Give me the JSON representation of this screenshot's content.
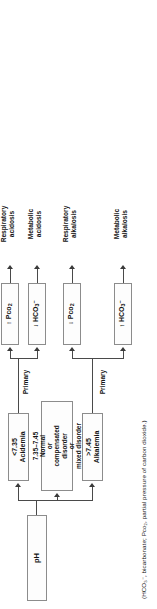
{
  "diagram": {
    "root": {
      "label": "pH"
    },
    "branches": [
      {
        "id": "alkalemia",
        "condition_line1": ">7.45",
        "condition_line2": "Alkalemia",
        "primary_label": "Primary",
        "outcomes": [
          {
            "id": "hco3-up",
            "measure_arrow": "↑",
            "measure_text": "HCO",
            "measure_sub": "3",
            "measure_sup": "−",
            "result_line1": "Metabolic",
            "result_line2": "alkalosis"
          },
          {
            "id": "pco2-down",
            "measure_arrow": "↓",
            "measure_text": "Pco",
            "measure_sub": "2",
            "measure_sup": "",
            "result_line1": "Respiratory",
            "result_line2": "alkalosis"
          }
        ]
      },
      {
        "id": "normal",
        "line1": "7.35–7.45",
        "line2": "Normal",
        "line3": "or",
        "line4": "compensated",
        "line5": "disorder",
        "line6": "or",
        "line7": "mixed disorder"
      },
      {
        "id": "acidemia",
        "condition_line1": "<7.35",
        "condition_line2": "Acidemia",
        "primary_label": "Primary",
        "outcomes": [
          {
            "id": "hco3-down",
            "measure_arrow": "↓",
            "measure_text": "HCO",
            "measure_sub": "3",
            "measure_sup": "−",
            "result_line1": "Metabolic",
            "result_line2": "acidosis"
          },
          {
            "id": "pco2-up",
            "measure_arrow": "↑",
            "measure_text": "Pco",
            "measure_sub": "2",
            "measure_sup": "",
            "result_line1": "Respiratory",
            "result_line2": "acidosis"
          }
        ]
      }
    ],
    "footnote": "(HCO₃⁻, bicarbonate; Pco₂, partial pressure of carbon dioxide.)",
    "colors": {
      "box_border": "#8c8c8c",
      "box_fill": "#fdfdfd",
      "connector": "#4a4a4a",
      "text": "#141414",
      "background": "#ffffff"
    }
  }
}
